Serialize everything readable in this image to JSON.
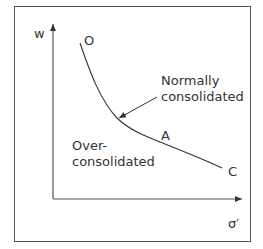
{
  "diagram": {
    "y_axis_label": "w",
    "x_axis_label": "σ′",
    "points": {
      "O": "O",
      "A": "A",
      "C": "C"
    },
    "annotations": {
      "normally_line1": "Normally",
      "normally_line2": "consolidated",
      "over_line1": "Over-",
      "over_line2": "consolidated"
    },
    "colors": {
      "line": "#333333",
      "frame": "#555555",
      "text": "#333333"
    }
  }
}
